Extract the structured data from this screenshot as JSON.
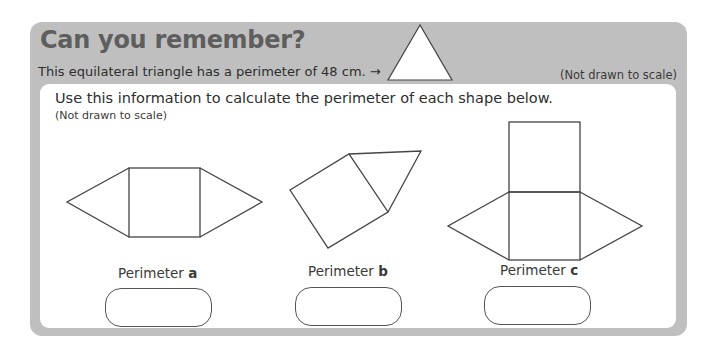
{
  "header": {
    "title": "Can you remember?",
    "intro": "This equilateral triangle has a perimeter of 48 cm. →",
    "note": "(Not drawn to scale)",
    "reference_shape": "equilateral-triangle"
  },
  "task": {
    "instruction": "Use this information to calculate the perimeter of each shape below.",
    "note": "(Not drawn to scale)"
  },
  "shapes": [
    {
      "id": "a",
      "description": "square with two triangles on left and right"
    },
    {
      "id": "b",
      "description": "tilted square with triangle on top-right side"
    },
    {
      "id": "c",
      "description": "two stacked squares with triangles on left and right of lower square"
    }
  ],
  "answers": [
    {
      "label": "Perimeter ",
      "letter": "a",
      "value": ""
    },
    {
      "label": "Perimeter ",
      "letter": "b",
      "value": ""
    },
    {
      "label": "Perimeter ",
      "letter": "c",
      "value": ""
    }
  ],
  "colors": {
    "panel_grey": "#bfbfbf",
    "title_grey": "#5e5e5e",
    "line": "#444444"
  }
}
